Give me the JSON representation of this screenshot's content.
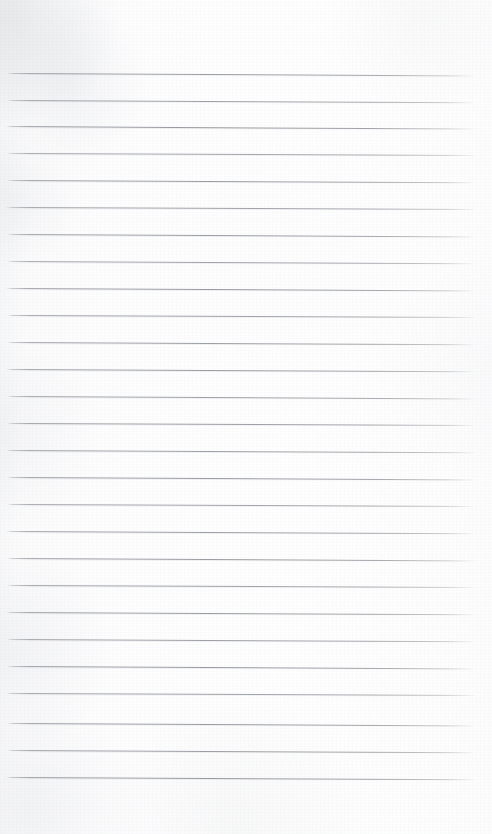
{
  "document": {
    "kind": "scanned-blank-lined-page",
    "title": "Blank Lined Notebook Page",
    "page_label": "",
    "visible_text": "",
    "handwriting": "",
    "notes_text": ""
  },
  "canvas": {
    "width": 492,
    "height": 834
  },
  "paper": {
    "background_color": "#fdfdfd",
    "edge_tint_color": "#f4f5f6",
    "mottle_color": "#aaaeb4",
    "texture": "faint-fibre-grain",
    "orientation": "portrait"
  },
  "ruling": {
    "line_color": "#84878d",
    "line_color_soft": "#c4c7cc",
    "line_thickness_px": 1,
    "line_count": 27,
    "first_line_y": 73,
    "line_spacing_px": 27.1,
    "line_start_x": 7,
    "line_end_x": 474,
    "line_slope_drop_px": 2.2,
    "rule_style": "single-horizontal-rules",
    "margin_rule": "none",
    "lines": [
      {
        "index": 1,
        "y": 73,
        "x1": 7,
        "x2": 474,
        "drop": 2.4,
        "opacity": 0.82
      },
      {
        "index": 2,
        "y": 100,
        "x1": 7,
        "x2": 474,
        "drop": 2.2,
        "opacity": 0.8
      },
      {
        "index": 3,
        "y": 126,
        "x1": 6,
        "x2": 473,
        "drop": 2.6,
        "opacity": 0.86
      },
      {
        "index": 4,
        "y": 153,
        "x1": 7,
        "x2": 474,
        "drop": 2.0,
        "opacity": 0.78
      },
      {
        "index": 5,
        "y": 180,
        "x1": 7,
        "x2": 473,
        "drop": 2.3,
        "opacity": 0.84
      },
      {
        "index": 6,
        "y": 207,
        "x1": 6,
        "x2": 474,
        "drop": 2.1,
        "opacity": 0.8
      },
      {
        "index": 7,
        "y": 234,
        "x1": 7,
        "x2": 474,
        "drop": 2.4,
        "opacity": 0.83
      },
      {
        "index": 8,
        "y": 261,
        "x1": 7,
        "x2": 473,
        "drop": 2.2,
        "opacity": 0.79
      },
      {
        "index": 9,
        "y": 288,
        "x1": 6,
        "x2": 474,
        "drop": 2.5,
        "opacity": 0.85
      },
      {
        "index": 10,
        "y": 315,
        "x1": 7,
        "x2": 474,
        "drop": 2.0,
        "opacity": 0.8
      },
      {
        "index": 11,
        "y": 342,
        "x1": 7,
        "x2": 473,
        "drop": 2.3,
        "opacity": 0.82
      },
      {
        "index": 12,
        "y": 369,
        "x1": 6,
        "x2": 474,
        "drop": 2.2,
        "opacity": 0.84
      },
      {
        "index": 13,
        "y": 396,
        "x1": 7,
        "x2": 474,
        "drop": 2.4,
        "opacity": 0.8
      },
      {
        "index": 14,
        "y": 423,
        "x1": 7,
        "x2": 473,
        "drop": 2.1,
        "opacity": 0.83
      },
      {
        "index": 15,
        "y": 450,
        "x1": 6,
        "x2": 474,
        "drop": 2.3,
        "opacity": 0.81
      },
      {
        "index": 16,
        "y": 477,
        "x1": 7,
        "x2": 474,
        "drop": 2.5,
        "opacity": 0.85
      },
      {
        "index": 17,
        "y": 504,
        "x1": 7,
        "x2": 473,
        "drop": 2.0,
        "opacity": 0.79
      },
      {
        "index": 18,
        "y": 531,
        "x1": 6,
        "x2": 474,
        "drop": 2.2,
        "opacity": 0.82
      },
      {
        "index": 19,
        "y": 558,
        "x1": 7,
        "x2": 474,
        "drop": 2.4,
        "opacity": 0.84
      },
      {
        "index": 20,
        "y": 585,
        "x1": 7,
        "x2": 473,
        "drop": 2.1,
        "opacity": 0.8
      },
      {
        "index": 21,
        "y": 612,
        "x1": 6,
        "x2": 474,
        "drop": 2.3,
        "opacity": 0.83
      },
      {
        "index": 22,
        "y": 639,
        "x1": 7,
        "x2": 474,
        "drop": 2.2,
        "opacity": 0.81
      },
      {
        "index": 23,
        "y": 666,
        "x1": 7,
        "x2": 473,
        "drop": 2.5,
        "opacity": 0.85
      },
      {
        "index": 24,
        "y": 693,
        "x1": 6,
        "x2": 474,
        "drop": 2.0,
        "opacity": 0.8
      },
      {
        "index": 25,
        "y": 723,
        "x1": 7,
        "x2": 474,
        "drop": 2.4,
        "opacity": 0.84
      },
      {
        "index": 26,
        "y": 750,
        "x1": 7,
        "x2": 473,
        "drop": 2.2,
        "opacity": 0.82
      },
      {
        "index": 27,
        "y": 777,
        "x1": 6,
        "x2": 474,
        "drop": 2.3,
        "opacity": 0.86
      }
    ]
  },
  "margins": {
    "top_px": 70,
    "bottom_px": 54,
    "left_px": 7,
    "right_px": 17
  }
}
